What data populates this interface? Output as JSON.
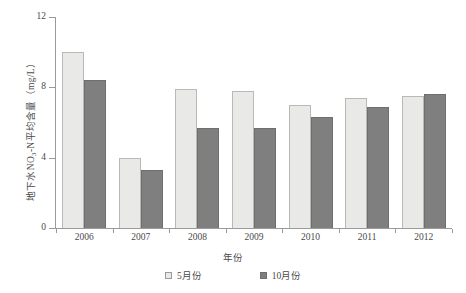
{
  "chart_data": {
    "type": "bar",
    "title": "",
    "xlabel": "年份",
    "ylabel": "地下水NO3-N平均含量（mg/L）",
    "categories": [
      "2006",
      "2007",
      "2008",
      "2009",
      "2010",
      "2011",
      "2012"
    ],
    "series": [
      {
        "name": "5月份",
        "values": [
          10.0,
          4.0,
          7.9,
          7.8,
          7.0,
          7.4,
          7.5
        ],
        "color": "#e9e9e7"
      },
      {
        "name": "10月份",
        "values": [
          8.4,
          3.3,
          5.7,
          5.7,
          6.3,
          6.9,
          7.6
        ],
        "color": "#7f7f7f"
      }
    ],
    "ylim": [
      0,
      12
    ],
    "yticks": [
      "0",
      "4",
      "8",
      "12"
    ],
    "ytick_values": [
      0,
      4,
      8,
      12
    ],
    "grid": false,
    "legend_position": "bottom"
  },
  "axis": {
    "ylabel_main": "地下水NO",
    "ylabel_sub": "3",
    "ylabel_tail": "-N平均含量（mg/L）"
  }
}
